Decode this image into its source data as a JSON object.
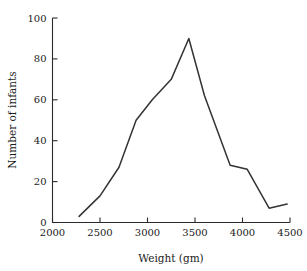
{
  "chart_data": {
    "type": "line",
    "title": "",
    "xlabel": "Weight (gm)",
    "ylabel": "Number of infants",
    "xlim": [
      2000,
      4500
    ],
    "ylim": [
      0,
      100
    ],
    "xticks": [
      2000,
      2500,
      3000,
      3500,
      4000,
      4500
    ],
    "yticks": [
      0,
      20,
      40,
      60,
      80,
      100
    ],
    "xtick_labels": [
      "2000",
      "2500",
      "3000",
      "3500",
      "4000",
      "4500"
    ],
    "ytick_labels": [
      "0",
      "20",
      "40",
      "60",
      "80",
      "100"
    ],
    "grid": false,
    "legend": false,
    "legend_position": "none",
    "line_color": "#333333",
    "series": [
      {
        "name": "Number of infants",
        "x": [
          2280,
          2500,
          2700,
          2880,
          3050,
          3250,
          3435,
          3600,
          3870,
          4050,
          4280,
          4470
        ],
        "values": [
          3,
          13,
          27,
          50,
          60,
          70,
          90,
          62,
          28,
          26,
          7,
          9
        ]
      }
    ]
  },
  "axes": {
    "y_title": "Number of infants",
    "x_title": "Weight (gm)"
  }
}
